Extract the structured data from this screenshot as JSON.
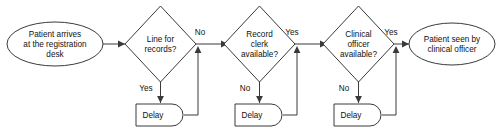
{
  "diagram": {
    "type": "flowchart",
    "orientation": "left-to-right",
    "colors": {
      "background": "#ffffff",
      "shape_fill": "#ffffff",
      "shape_stroke": "#3a3a3a",
      "text": "#111111",
      "connector": "#3a3a3a"
    },
    "nodes": {
      "start": {
        "shape": "ellipse",
        "lines": [
          "Patient arrives",
          "at the registration",
          "desk"
        ]
      },
      "decision1": {
        "shape": "diamond",
        "lines": [
          "Line for",
          "records?"
        ]
      },
      "decision2": {
        "shape": "diamond",
        "lines": [
          "Record",
          "clerk",
          "available?"
        ]
      },
      "decision3": {
        "shape": "diamond",
        "lines": [
          "Clinical",
          "officer",
          "available?"
        ]
      },
      "delay1": {
        "shape": "delay",
        "label": "Delay"
      },
      "delay2": {
        "shape": "delay",
        "label": "Delay"
      },
      "delay3": {
        "shape": "delay",
        "label": "Delay"
      },
      "end": {
        "shape": "ellipse",
        "lines": [
          "Patient seen by",
          "clinical officer"
        ]
      }
    },
    "edge_labels": {
      "d1_no": "No",
      "d1_yes": "Yes",
      "d2_yes": "Yes",
      "d2_no": "No",
      "d3_yes": "Yes",
      "d3_no": "No"
    }
  }
}
